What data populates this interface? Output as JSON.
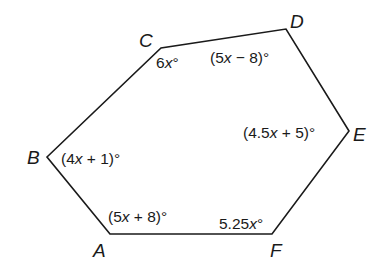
{
  "diagram": {
    "type": "hexagon",
    "vertices": [
      {
        "name": "A",
        "x": 110,
        "y": 234,
        "label_x": 93,
        "label_y": 257
      },
      {
        "name": "B",
        "x": 47,
        "y": 157,
        "label_x": 27,
        "label_y": 164
      },
      {
        "name": "C",
        "x": 161,
        "y": 48,
        "label_x": 139,
        "label_y": 47
      },
      {
        "name": "D",
        "x": 286,
        "y": 29,
        "label_x": 290,
        "label_y": 28
      },
      {
        "name": "E",
        "x": 349,
        "y": 131,
        "label_x": 353,
        "label_y": 141
      },
      {
        "name": "F",
        "x": 272,
        "y": 234,
        "label_x": 270,
        "label_y": 257
      }
    ],
    "angles": [
      {
        "vertex": "A",
        "expr": "(5x + 8)°",
        "x": 108,
        "y": 222
      },
      {
        "vertex": "B",
        "expr": "(4x + 1)°",
        "x": 61,
        "y": 164
      },
      {
        "vertex": "C",
        "expr": "6x°",
        "x": 156,
        "y": 68
      },
      {
        "vertex": "D",
        "expr": "(5x − 8)°",
        "x": 210,
        "y": 63
      },
      {
        "vertex": "E",
        "expr": "(4.5x + 5)°",
        "x": 243,
        "y": 138
      },
      {
        "vertex": "F",
        "expr": "5.25x°",
        "x": 219,
        "y": 229
      }
    ],
    "colors": {
      "stroke": "#1a1a1a",
      "background": "#ffffff"
    }
  }
}
